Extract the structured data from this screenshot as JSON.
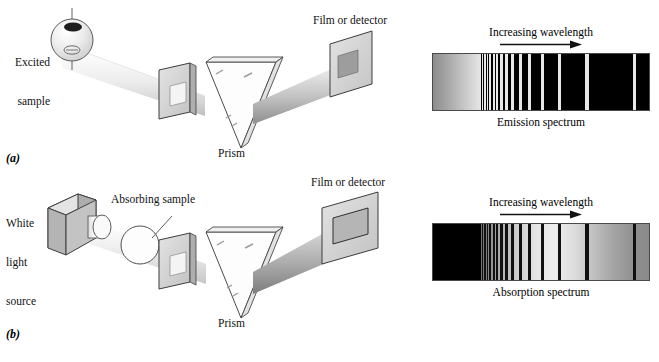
{
  "figure": {
    "panel_a": {
      "tag": "(a)",
      "labels": {
        "source": "Excited\nsample",
        "source_line1": "Excited",
        "source_line2": "sample",
        "prism": "Prism",
        "detector": "Film or detector"
      }
    },
    "panel_b": {
      "tag": "(b)",
      "labels": {
        "source_line1": "White",
        "source_line2": "light",
        "source_line3": "source",
        "sample": "Absorbing sample",
        "prism": "Prism",
        "detector": "Film or detector"
      }
    }
  },
  "spectra": [
    {
      "id": "emission",
      "top_label": "Increasing wavelength",
      "caption": "Emission spectrum",
      "arrow_direction": "right",
      "background": "#000000",
      "line_color": "#e8e8e8",
      "continuum": {
        "present": true,
        "from": "#8c8c8c",
        "to": "#e6e6e6",
        "x_pct": 0,
        "w_pct": 22
      },
      "lines_pct": [
        22.5,
        23.6,
        24.8,
        26.1,
        27.6,
        29.3,
        31.2,
        33.5,
        36.3,
        39.8,
        44.2,
        50.0,
        58.0,
        70.5,
        92.5
      ]
    },
    {
      "id": "absorption",
      "top_label": "Increasing wavelength",
      "caption": "Absorption spectrum",
      "arrow_direction": "right",
      "background": "#d8d8d8",
      "line_color": "#101010",
      "continuum": {
        "present": true,
        "from": "#000000",
        "to": "#000000",
        "x_pct": 0,
        "w_pct": 22
      },
      "lines_pct": [
        22.5,
        23.6,
        24.8,
        26.1,
        27.6,
        29.3,
        31.2,
        33.5,
        36.3,
        39.8,
        44.2,
        50.0,
        58.0,
        70.5,
        92.5
      ]
    }
  ],
  "colors": {
    "ink": "#111111",
    "beam_light": "#f2f2f2",
    "beam_mid": "#cfcfcf",
    "beam_dark": "#9a9a9a",
    "plate_face": "#d2d2d2",
    "plate_edge": "#3b3b3b",
    "cube_front": "#b9b9b9",
    "cube_top": "#d6d6d6",
    "cube_side": "#9c9c9c"
  },
  "icons": {
    "arrow": "increasing-wavelength-arrow",
    "prism": "prism-icon",
    "slit": "slit-plate-icon",
    "detector": "film-detector-icon",
    "sphere_source": "excited-sample-icon",
    "cube_source": "white-light-source-icon",
    "absorbing_sample": "absorbing-sample-icon"
  }
}
